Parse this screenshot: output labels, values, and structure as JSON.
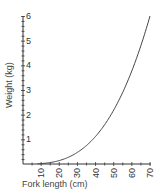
{
  "chart_data": {
    "type": "line",
    "title": "",
    "xlabel": "Fork length (cm)",
    "ylabel": "Weight (kg)",
    "xlim": [
      0,
      70
    ],
    "ylim": [
      0,
      6
    ],
    "x_ticks": [
      10,
      20,
      30,
      40,
      50,
      60,
      70
    ],
    "y_ticks": [
      1,
      2,
      3,
      4,
      5,
      6
    ],
    "grid": false,
    "legend": null,
    "series": [
      {
        "name": "Weight vs fork length",
        "x": [
          0,
          5,
          10,
          15,
          20,
          25,
          30,
          35,
          40,
          45,
          50,
          55,
          60,
          65,
          70
        ],
        "y": [
          0,
          0.002,
          0.02,
          0.06,
          0.14,
          0.27,
          0.47,
          0.75,
          1.12,
          1.6,
          2.19,
          2.91,
          3.78,
          4.81,
          6.0
        ]
      }
    ]
  },
  "axes": {
    "xlabel": "Fork length (cm)",
    "ylabel": "Weight (kg)",
    "x_tick_labels": [
      "10",
      "20",
      "30",
      "40",
      "50",
      "60",
      "70"
    ],
    "y_tick_labels": [
      "1",
      "2",
      "3",
      "4",
      "5",
      "6"
    ]
  },
  "colors": {
    "axis": "#333333",
    "curve": "#444444"
  }
}
